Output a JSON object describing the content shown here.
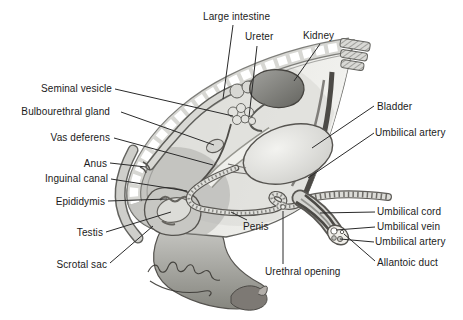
{
  "figure": {
    "colors": {
      "background": "#ffffff",
      "line_art": "#4a4a46",
      "leader_line": "#2a2a2a",
      "label_text": "#1b1b1b",
      "shading_mid": "#b9b9b5",
      "shading_dark": "#6e6e6a"
    },
    "labels": {
      "large_intestine": "Large intestine",
      "ureter": "Ureter",
      "kidney": "Kidney",
      "seminal_vesicle": "Seminal vesicle",
      "bulbourethral_gland": "Bulbourethral gland",
      "vas_deferens": "Vas deferens",
      "anus": "Anus",
      "inguinal_canal": "Inguinal canal",
      "epididymis": "Epididymis",
      "testis": "Testis",
      "scrotal_sac": "Scrotal sac",
      "bladder": "Bladder",
      "umbilical_artery_upper": "Umbilical artery",
      "umbilical_cord": "Umbilical cord",
      "umbilical_vein": "Umbilical vein",
      "umbilical_artery_lower": "Umbilical artery",
      "allantoic_duct": "Allantoic duct",
      "penis": "Penis",
      "urethral_opening": "Urethral opening"
    }
  }
}
